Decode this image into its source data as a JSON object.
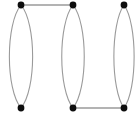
{
  "figure": {
    "background_color": "#ffffff",
    "width": 140,
    "height": 114
  },
  "style": {
    "node_color": "#0d0d0d",
    "node_radius": 3.4,
    "edge_color": "#9a9a9a",
    "multi_edge_width": 1.1,
    "link_edge_width": 1.4
  },
  "chart_data": {
    "type": "diagram",
    "graph_kind": "multigraph",
    "title": "",
    "node_count": 6,
    "edge_count": 8,
    "nodes": [
      {
        "id": "tl",
        "label": "",
        "x": 21,
        "y": 5
      },
      {
        "id": "bl",
        "label": "",
        "x": 21,
        "y": 108
      },
      {
        "id": "tm",
        "label": "",
        "x": 73,
        "y": 5
      },
      {
        "id": "bm",
        "label": "",
        "x": 73,
        "y": 108
      },
      {
        "id": "tr",
        "label": "",
        "x": 124,
        "y": 5
      },
      {
        "id": "br",
        "label": "",
        "x": 124,
        "y": 108
      }
    ],
    "edges": [
      {
        "source": "tl",
        "target": "bl",
        "kind": "curved",
        "bow": -15.5
      },
      {
        "source": "tl",
        "target": "bl",
        "kind": "curved",
        "bow": 15.5
      },
      {
        "source": "tm",
        "target": "bm",
        "kind": "curved",
        "bow": -15.0
      },
      {
        "source": "tm",
        "target": "bm",
        "kind": "curved",
        "bow": 15.0
      },
      {
        "source": "tr",
        "target": "br",
        "kind": "curved",
        "bow": -13.5
      },
      {
        "source": "tr",
        "target": "br",
        "kind": "curved",
        "bow": 13.5
      },
      {
        "source": "tl",
        "target": "tm",
        "kind": "straight",
        "bow": 0
      },
      {
        "source": "bm",
        "target": "br",
        "kind": "straight",
        "bow": 0
      }
    ],
    "layout_hints": {
      "rows": 2,
      "columns": 3,
      "top_row_y": 5,
      "bottom_row_y": 108,
      "column_x": [
        21,
        73,
        124
      ],
      "grid": false,
      "legend": "none",
      "axes": "none"
    }
  }
}
